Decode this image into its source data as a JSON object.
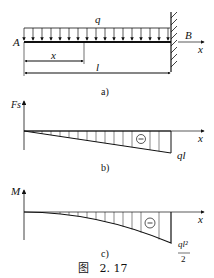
{
  "figure": {
    "caption": "图   2. 17",
    "panel_a": {
      "caption": "a)",
      "load_label": "q",
      "left_end_label": "A",
      "right_end_label": "B",
      "axis_label": "x",
      "distance_label": "x",
      "length_label": "l",
      "support": "fixed (clamped) at right end B",
      "load": "uniformly distributed downward load q over full length"
    },
    "panel_b": {
      "caption": "b)",
      "y_axis_label": "Fs",
      "x_axis_label": "x",
      "end_value_label": "ql",
      "sign": "⊖",
      "shape": "linear, from 0 at A to -ql at B"
    },
    "panel_c": {
      "caption": "c)",
      "y_axis_label": "M",
      "x_axis_label": "x",
      "end_value_numerator": "ql²",
      "end_value_denominator": "2",
      "sign": "⊖",
      "shape": "parabolic, from 0 at A to -ql²/2 at B"
    }
  }
}
